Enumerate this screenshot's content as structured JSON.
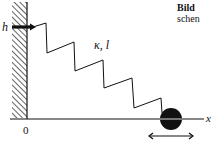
{
  "figure": {
    "caption_title": "Bild",
    "caption_fragment": "schen",
    "labels": {
      "height": "h",
      "chain": "κ, l",
      "origin": "0",
      "axis": "x"
    },
    "elements": [
      "hatched wall",
      "bold arrow at height h",
      "zigzag spring/chain",
      "ground axis",
      "black ball on axis",
      "double-headed arrow under ball"
    ],
    "colors": {
      "ink": "#111111",
      "background": "#ffffff"
    }
  }
}
